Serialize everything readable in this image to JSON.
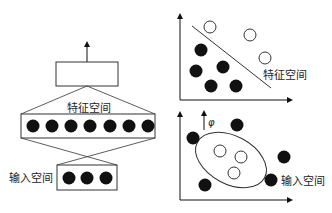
{
  "network": {
    "feature_space_label": "特征空间",
    "input_space_label": "输入空间",
    "feature_nodes": 7,
    "input_nodes": 3
  },
  "feature_plot": {
    "label": "特征空间",
    "filled_points": [
      [
        192,
        50
      ],
      [
        187,
        71
      ],
      [
        211,
        67
      ],
      [
        211,
        86
      ],
      [
        235,
        86
      ]
    ],
    "hollow_points": [
      [
        210,
        27
      ],
      [
        250,
        36
      ],
      [
        265,
        58
      ]
    ],
    "separator": [
      [
        192,
        26
      ],
      [
        271,
        88
      ]
    ]
  },
  "input_plot": {
    "label": "输入空间",
    "mapping_symbol": "φ",
    "filled_points": [
      [
        237,
        125
      ],
      [
        193,
        138
      ],
      [
        283,
        157
      ],
      [
        205,
        185
      ],
      [
        270,
        180
      ]
    ],
    "hollow_points": [
      [
        220,
        151
      ],
      [
        242,
        157
      ],
      [
        234,
        173
      ]
    ],
    "ellipse": {
      "cx": 232,
      "cy": 160,
      "rx": 40,
      "ry": 24,
      "rotate": 25
    }
  },
  "colors": {
    "ink": "#111111",
    "line": "#333333"
  }
}
